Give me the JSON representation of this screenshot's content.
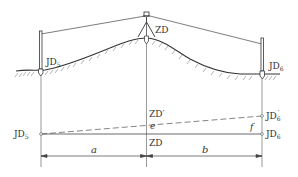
{
  "diagram": {
    "type": "surveying-schematic",
    "elevation_view": {
      "left_point": {
        "label": "JD",
        "sub": "5"
      },
      "right_point": {
        "label": "JD",
        "sub": "6"
      },
      "instrument_label": "ZD"
    },
    "plan_view": {
      "left_point": {
        "label": "JD",
        "sub": "5"
      },
      "right_point": {
        "label": "JD",
        "sub": "6"
      },
      "right_point_prime": {
        "label": "JD",
        "sub": "6",
        "prime": "′"
      },
      "zd_label": "ZD",
      "zd_prime_label": "ZD′",
      "e_label": "e",
      "f_label": "f",
      "dim_a": "a",
      "dim_b": "b"
    },
    "colors": {
      "line": "#333333",
      "hatch": "#555555",
      "dashed": "#666666"
    }
  }
}
